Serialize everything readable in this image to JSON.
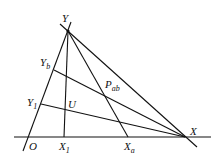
{
  "diagram": {
    "points": {
      "Y": {
        "label": "Y",
        "x": 68,
        "y": 31
      },
      "X": {
        "label": "X",
        "x": 185,
        "y": 137
      },
      "O": {
        "label": "O",
        "x": 27,
        "y": 137
      },
      "X1": {
        "label": "X",
        "sub": "1",
        "x": 64,
        "y": 137
      },
      "Xa": {
        "label": "X",
        "sub": "a",
        "x": 128,
        "y": 137
      },
      "Yb": {
        "label": "Y",
        "sub": "b",
        "x": 54,
        "y": 70
      },
      "Y1": {
        "label": "Y",
        "sub": "1",
        "x": 41,
        "y": 104
      },
      "U": {
        "label": "U",
        "x": 65,
        "y": 109
      },
      "Pab": {
        "label": "P",
        "sub": "ab",
        "x": 102,
        "y": 88
      }
    },
    "labels": {
      "Y": "Y",
      "X": "X",
      "O": "O",
      "X1": "X",
      "X1_sub": "1",
      "Xa": "X",
      "Xa_sub": "a",
      "Yb": "Y",
      "Yb_sub": "b",
      "Y1": "Y",
      "Y1_sub": "1",
      "U": "U",
      "Pab": "P",
      "Pab_sub": "ab"
    }
  }
}
